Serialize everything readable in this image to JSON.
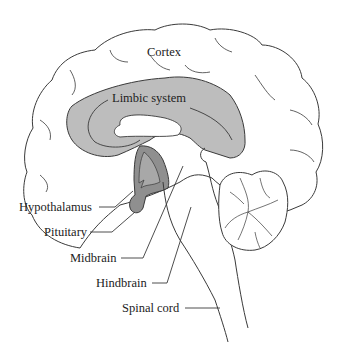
{
  "diagram": {
    "colors": {
      "outline": "#3a3a3a",
      "cortex_fill": "#ffffff",
      "limbic_fill": "#bdbdbd",
      "hypothalamus_fill": "#8f8f8f",
      "inner_fill": "#a8a8a8",
      "background": "#ffffff"
    },
    "labels": {
      "cortex": "Cortex",
      "limbic": "Limbic system",
      "hypothalamus": "Hypothalamus",
      "pituitary": "Pituitary",
      "midbrain": "Midbrain",
      "hindbrain": "Hindbrain",
      "spinal_cord": "Spinal cord"
    }
  }
}
